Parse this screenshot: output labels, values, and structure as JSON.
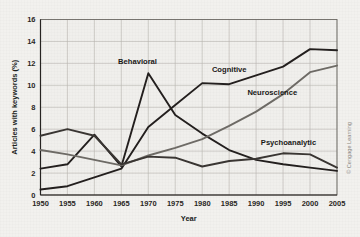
{
  "figure": {
    "background_color": "#f2f1ee",
    "plot_background_color": "#f0efec",
    "grid_color": "#b9b6b0",
    "credit": "© Cengage Learning"
  },
  "chart_data": {
    "type": "line",
    "title": "",
    "xlabel": "Year",
    "ylabel": "Articles with keywords (%)",
    "x": [
      1950,
      1955,
      1960,
      1965,
      1970,
      1975,
      1980,
      1985,
      1990,
      1995,
      2000,
      2005
    ],
    "categories": [
      "1950",
      "1955",
      "1960",
      "1965",
      "1970",
      "1975",
      "1980",
      "1985",
      "1990",
      "1995",
      "2000",
      "2005"
    ],
    "xlim": [
      1950,
      2005
    ],
    "ylim": [
      0,
      16
    ],
    "yticks": [
      0,
      2,
      4,
      6,
      8,
      10,
      12,
      14,
      16
    ],
    "ytick_labels": [
      "0",
      "2",
      "4",
      "6",
      "8",
      "10",
      "12",
      "14",
      "16"
    ],
    "xticks": [
      1950,
      1955,
      1960,
      1965,
      1970,
      1975,
      1980,
      1985,
      1990,
      1995,
      2000,
      2005
    ],
    "xtick_labels": [
      "1950",
      "1955",
      "1960",
      "1965",
      "1970",
      "1975",
      "1980",
      "1985",
      "1990",
      "1995",
      "2000",
      "2005"
    ],
    "grid": true,
    "legend": "inline-labels",
    "series": [
      {
        "name": "Behavioral",
        "color": "#231f1e",
        "label_x": 1968,
        "label_y": 11.9,
        "values": [
          2.4,
          2.8,
          5.5,
          2.6,
          11.1,
          7.3,
          5.6,
          4.1,
          3.2,
          2.8,
          2.5,
          2.2
        ]
      },
      {
        "name": "Cognitive",
        "color": "#231f1e",
        "label_x": 1985,
        "label_y": 11.2,
        "values": [
          0.5,
          0.8,
          1.6,
          2.4,
          6.2,
          8.2,
          10.2,
          10.1,
          10.9,
          11.7,
          13.3,
          13.2
        ]
      },
      {
        "name": "Neuroscience",
        "color": "#6e6b66",
        "label_x": 1993,
        "label_y": 9.1,
        "values": [
          4.1,
          3.7,
          3.2,
          2.7,
          3.6,
          4.3,
          5.1,
          6.3,
          7.6,
          9.2,
          11.2,
          11.8
        ]
      },
      {
        "name": "Psychoanalytic",
        "color": "#3a3633",
        "label_x": 1996,
        "label_y": 4.6,
        "values": [
          5.4,
          6.0,
          5.4,
          2.8,
          3.5,
          3.4,
          2.6,
          3.1,
          3.3,
          3.8,
          3.7,
          2.5
        ]
      }
    ]
  }
}
